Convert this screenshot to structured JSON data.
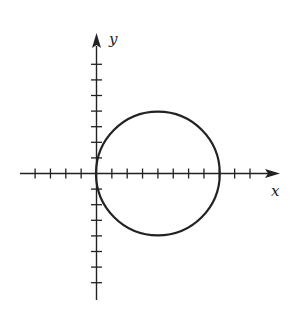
{
  "figure": {
    "type": "coordinate-plane",
    "axes": {
      "x_label": "x",
      "y_label": "y",
      "x_range": [
        -5,
        12
      ],
      "y_range": [
        -8,
        9
      ],
      "x_ticks": [
        -4,
        -3,
        -2,
        -1,
        1,
        2,
        3,
        4,
        5,
        6,
        7,
        8,
        9,
        10
      ],
      "y_ticks": [
        -7,
        -6,
        -5,
        -4,
        -3,
        -2,
        -1,
        1,
        2,
        3,
        4,
        5,
        6,
        7
      ]
    },
    "circle": {
      "center": [
        4,
        0
      ],
      "radius": 4,
      "equation": "(x - 4)^2 + y^2 = 16"
    },
    "colors": {
      "stroke": "#222222",
      "background": "#ffffff"
    }
  },
  "chart_data": {
    "type": "diagram",
    "title": "",
    "xlabel": "x",
    "ylabel": "y",
    "shapes": [
      {
        "kind": "circle",
        "cx": 4,
        "cy": 0,
        "r": 4
      }
    ],
    "x_ticks": [
      -4,
      -3,
      -2,
      -1,
      1,
      2,
      3,
      4,
      5,
      6,
      7,
      8,
      9,
      10
    ],
    "y_ticks": [
      -7,
      -6,
      -5,
      -4,
      -3,
      -2,
      -1,
      1,
      2,
      3,
      4,
      5,
      6,
      7
    ],
    "grid": false
  }
}
